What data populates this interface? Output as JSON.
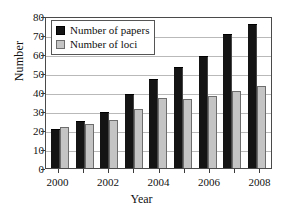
{
  "chart_data": {
    "type": "bar",
    "title": "",
    "xlabel": "Year",
    "ylabel": "Number",
    "categories": [
      "2000",
      "2001",
      "2002",
      "2003",
      "2004",
      "2005",
      "2006",
      "2007",
      "2008"
    ],
    "visible_tick_labels": [
      "2000",
      "2002",
      "2004",
      "2006",
      "2008"
    ],
    "ylim": [
      0,
      80
    ],
    "ytick_labels": [
      "80",
      "70",
      "60",
      "50",
      "40",
      "30",
      "20",
      "10",
      "0"
    ],
    "ytick_values": [
      80,
      70,
      60,
      50,
      40,
      30,
      20,
      10,
      0
    ],
    "grid": true,
    "grid_axis": "y",
    "legend_position": "top-left",
    "series": [
      {
        "name": "Number of papers",
        "color": "#141414",
        "values": [
          20,
          24,
          29,
          38.5,
          46.5,
          52.5,
          58.5,
          70,
          75.5
        ]
      },
      {
        "name": "Number of loci",
        "color": "#c4c4c4",
        "values": [
          21.5,
          23,
          25.5,
          31,
          37,
          36.5,
          38,
          40.5,
          43
        ]
      }
    ]
  },
  "legend": {
    "items": [
      {
        "label": "Number of papers",
        "swatch": "papers"
      },
      {
        "label": "Number of loci",
        "swatch": "loci"
      }
    ]
  }
}
